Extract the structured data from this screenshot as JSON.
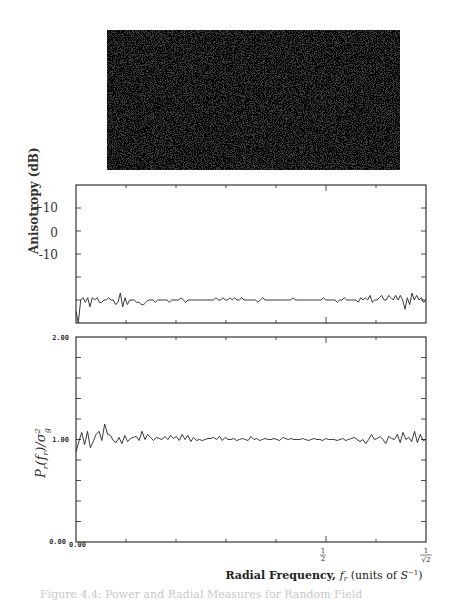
{
  "figure": {
    "caption": "Figure 4.4: Power and Radial Measures for Random Field",
    "image_panel": {
      "label": "random-noise-texture",
      "x": 107,
      "y": 30,
      "width": 293,
      "height": 140
    }
  },
  "chart_data": [
    {
      "type": "line",
      "title": "",
      "ylabel": "Anisotropy (dB)",
      "xlabel": "",
      "ylim": [
        -15,
        15
      ],
      "yticks": [
        {
          "value": 10,
          "label": "+10"
        },
        {
          "value": 0,
          "label": "0"
        },
        {
          "value": -10,
          "label": "-10"
        }
      ],
      "xlim": [
        0,
        0.7071
      ],
      "grid": false,
      "series": [
        {
          "name": "anisotropy",
          "x_range": [
            0,
            0.7071
          ],
          "values": [
            -12.5,
            -15,
            -10,
            -9.5,
            -10.5,
            -9.5,
            -11.5,
            -9.5,
            -10,
            -9.5,
            -10.5,
            -10.5,
            -10,
            -10,
            -9.5,
            -10,
            -10,
            -11,
            -10.5,
            -8.5,
            -11.5,
            -9.5,
            -11,
            -10,
            -10,
            -10,
            -10.5,
            -10.5,
            -11,
            -11,
            -10.5,
            -10,
            -10,
            -10,
            -10.5,
            -10,
            -10,
            -10,
            -10,
            -10,
            -10.5,
            -10,
            -10,
            -10,
            -10,
            -9.5,
            -10,
            -10.5,
            -10,
            -10,
            -10,
            -10,
            -10,
            -10,
            -10,
            -10,
            -10,
            -10,
            -10,
            -10,
            -9.5,
            -10,
            -10,
            -9.5,
            -10,
            -10,
            -9.5,
            -10,
            -9.5,
            -10,
            -10,
            -9.5,
            -10,
            -10,
            -10,
            -10,
            -10,
            -10,
            -10.5,
            -10,
            -9.5,
            -10,
            -10,
            -10,
            -10,
            -10,
            -10,
            -10,
            -10,
            -10,
            -10,
            -10,
            -10,
            -9.5,
            -10,
            -10,
            -10,
            -10,
            -10,
            -10,
            -10,
            -10,
            -10,
            -10,
            -10,
            -10,
            -9.5,
            -10,
            -10,
            -10,
            -10,
            -10,
            -10.5,
            -10,
            -10,
            -9.5,
            -10,
            -10,
            -10,
            -10,
            -10,
            -10.5,
            -9.5,
            -10,
            -9.5,
            -10,
            -9,
            -10.5,
            -10,
            -10,
            -9.5,
            -9,
            -10,
            -10,
            -9,
            -9.5,
            -10,
            -9,
            -10,
            -9,
            -10,
            -12,
            -9.5,
            -11,
            -8.5,
            -10,
            -9,
            -10,
            -9.5,
            -10.5,
            -10
          ]
        }
      ]
    },
    {
      "type": "line",
      "title": "",
      "ylabel": "P_r(f_r)/σ_g²",
      "xlabel": "Radial Frequency, f_r (units of S⁻¹)",
      "ylim": [
        0.0,
        2.0
      ],
      "yticks": [
        {
          "value": 2.0,
          "label": "2.00"
        },
        {
          "value": 1.0,
          "label": "1.00"
        },
        {
          "value": 0.0,
          "label": "0.00"
        }
      ],
      "xlim": [
        0,
        0.7071
      ],
      "xticks": [
        {
          "value": 0.0,
          "label": "0.00"
        },
        {
          "value": 0.5,
          "label": "1/2"
        },
        {
          "value": 0.7071,
          "label": "1/√2"
        }
      ],
      "grid": false,
      "series": [
        {
          "name": "normalized radial power",
          "x_range": [
            0,
            0.7071
          ],
          "values": [
            0.88,
            0.98,
            1.07,
            0.95,
            1.08,
            0.92,
            0.98,
            1.05,
            1.08,
            0.99,
            1.15,
            1.05,
            1.04,
            0.99,
            0.97,
            1.02,
            0.96,
            1.04,
            0.98,
            1.01,
            1.02,
            1.03,
            0.99,
            1.08,
            1.0,
            1.05,
            1.02,
            0.99,
            1.02,
            1.01,
            1.0,
            1.03,
            1.0,
            1.04,
            1.01,
            1.03,
            0.99,
            1.05,
            1.0,
            1.04,
            0.98,
            1.02,
            0.99,
            1.0,
            0.99,
            1.0,
            1.01,
            1.01,
            1.02,
            1.0,
            1.03,
            0.99,
            1.02,
            1.0,
            1.0,
            1.01,
            0.99,
            1.0,
            1.01,
            1.0,
            0.99,
            1.03,
            1.0,
            1.01,
            0.99,
            1.0,
            1.01,
            1.0,
            1.0,
            1.01,
            1.0,
            0.99,
            1.02,
            1.01,
            1.0,
            1.01,
            1.0,
            1.0,
            1.0,
            1.01,
            1.0,
            0.99,
            1.0,
            1.01,
            1.0,
            1.0,
            0.99,
            1.01,
            1.0,
            1.0,
            1.0,
            0.99,
            1.0,
            1.01,
            0.99,
            1.0,
            1.01,
            1.02,
            1.0,
            0.98,
            1.0,
            0.96,
            1.0,
            1.05,
            1.0,
            1.01,
            1.03,
            1.0,
            0.96,
            1.03,
            1.01,
            1.0,
            1.05,
            0.97,
            1.07,
            1.0,
            1.02,
            0.98,
            1.08,
            0.97,
            1.05,
            0.99,
            1.0
          ]
        }
      ]
    }
  ]
}
